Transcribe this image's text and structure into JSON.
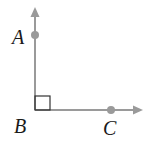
{
  "diagram": {
    "colors": {
      "line": "#9a9a9a",
      "point": "#9a9a9a",
      "label": "#1a1a1a",
      "background": "#ffffff"
    },
    "rays": [
      {
        "name": "ray-BA",
        "from": "B",
        "direction": "up",
        "arrow": true
      },
      {
        "name": "ray-BC",
        "from": "B",
        "direction": "right",
        "arrow": true
      }
    ],
    "points": [
      {
        "label": "A",
        "x": 35,
        "y": 35
      },
      {
        "label": "B",
        "x": 35,
        "y": 110
      },
      {
        "label": "C",
        "x": 111,
        "y": 110
      }
    ],
    "labels": {
      "A": "A",
      "B": "B",
      "C": "C"
    },
    "right_angle_marker": {
      "at": "B",
      "size": 15
    }
  }
}
